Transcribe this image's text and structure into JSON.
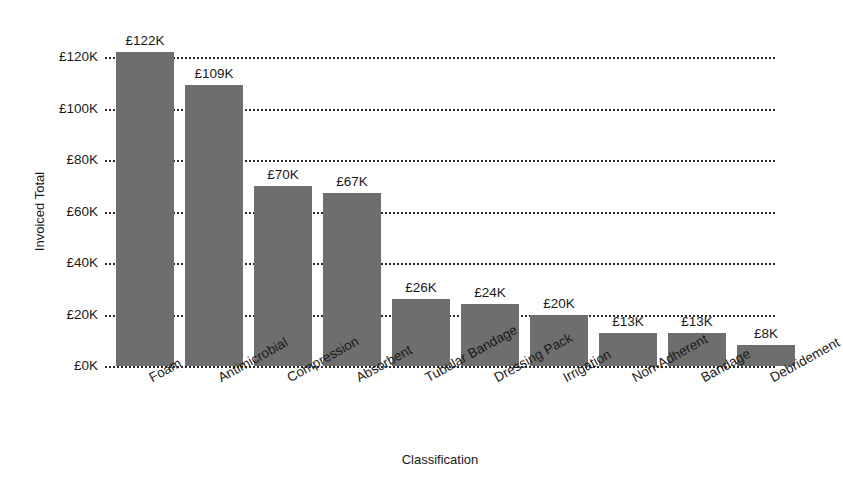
{
  "chart_data": {
    "type": "bar",
    "title": "",
    "subtitle": "",
    "xlabel": "Classification",
    "ylabel": "Invoiced Total",
    "categories": [
      "Foam",
      "Antimicrobial",
      "Compression",
      "Absorbent",
      "Tubular Bandage",
      "Dressing Pack",
      "Irrigation",
      "Non-Adherent",
      "Bandage",
      "Debridement"
    ],
    "values": [
      122,
      109,
      70,
      67,
      26,
      24,
      20,
      13,
      13,
      8
    ],
    "value_labels": [
      "£122K",
      "£109K",
      "£70K",
      "£67K",
      "£26K",
      "£24K",
      "£20K",
      "£13K",
      "£13K",
      "£8K"
    ],
    "unit": "£K",
    "ylim": [
      0,
      120
    ],
    "yticks": [
      0,
      20,
      40,
      60,
      80,
      100,
      120
    ],
    "ytick_labels": [
      "£0K",
      "£20K",
      "£40K",
      "£60K",
      "£80K",
      "£100K",
      "£120K"
    ],
    "grid": "horizontal-dotted",
    "legend": "none",
    "bar_color": "#6e6e6e",
    "background_color": "#ffffff",
    "text_color": "#1a1a1a",
    "gridline_color": "#2b2b2b",
    "xtick_label_rotation": -29
  }
}
